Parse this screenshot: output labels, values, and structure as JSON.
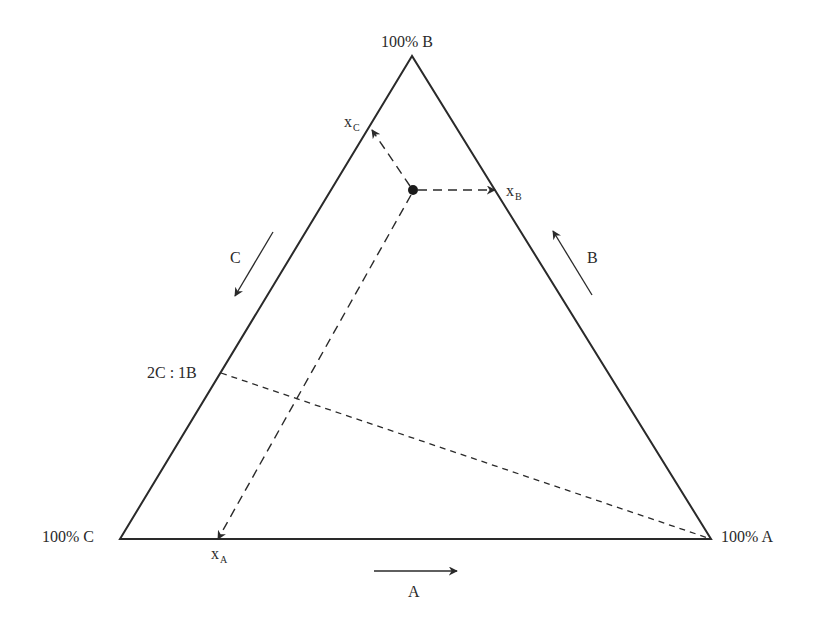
{
  "diagram": {
    "type": "ternary-phase-diagram",
    "vertices": {
      "B": {
        "label": "100% B",
        "x": 412,
        "y": 56
      },
      "C": {
        "label": "100% C",
        "x": 120,
        "y": 539
      },
      "A": {
        "label": "100% A",
        "x": 711,
        "y": 539
      }
    },
    "point": {
      "x": 413,
      "y": 190
    },
    "projections": {
      "xA": {
        "main": "x",
        "sub": "A",
        "end_x": 218,
        "end_y": 539
      },
      "xB": {
        "main": "x",
        "sub": "B",
        "end_x": 495,
        "end_y": 190
      },
      "xC": {
        "main": "x",
        "sub": "C",
        "end_x": 372,
        "end_y": 130
      }
    },
    "ratio_line": {
      "label": "2C : 1B",
      "from_x": 221,
      "from_y": 373,
      "to_x": 711,
      "to_y": 539
    },
    "direction_arrows": {
      "A": {
        "label": "A",
        "x1": 374,
        "y1": 571,
        "x2": 457,
        "y2": 571
      },
      "B": {
        "label": "B",
        "x1": 592,
        "y1": 295,
        "x2": 553,
        "y2": 231
      },
      "C": {
        "label": "C",
        "x1": 273,
        "y1": 232,
        "x2": 235,
        "y2": 296
      }
    },
    "colors": {
      "line": "#2a2a2a",
      "background": "#ffffff"
    }
  }
}
